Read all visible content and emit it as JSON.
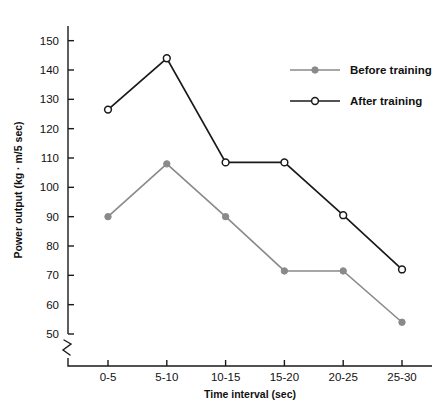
{
  "chart_data": {
    "type": "line",
    "title": "",
    "xlabel": "Time interval (sec)",
    "ylabel": "Power output (kg · m/5 sec)",
    "categories": [
      "0-5",
      "5-10",
      "10-15",
      "15-20",
      "20-25",
      "25-30"
    ],
    "ylim": [
      50,
      155
    ],
    "yticks": [
      50,
      60,
      70,
      80,
      90,
      100,
      110,
      120,
      130,
      140,
      150
    ],
    "ytick_labels": [
      "50",
      "60",
      "70",
      "80",
      "90",
      "100",
      "110",
      "120",
      "130",
      "140",
      "150"
    ],
    "axis_break": true,
    "grid": false,
    "legend_position": "top-right",
    "series": [
      {
        "name": "Before training",
        "values": [
          90,
          108,
          90,
          71.5,
          71.5,
          54
        ],
        "color": "#8a8a8a",
        "marker": "filled-circle"
      },
      {
        "name": "After training",
        "values": [
          126.5,
          144,
          108.5,
          108.5,
          90.5,
          72
        ],
        "color": "#1a1a1a",
        "marker": "open-circle"
      }
    ]
  },
  "axes": {
    "y_title": "Power output (kg · m/5 sec)",
    "x_title": "Time interval (sec)"
  },
  "legend": {
    "items": [
      {
        "label": "Before training"
      },
      {
        "label": "After training"
      }
    ]
  }
}
